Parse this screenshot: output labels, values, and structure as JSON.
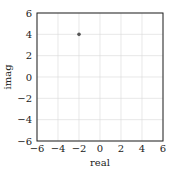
{
  "chart_data": {
    "type": "scatter",
    "title": "",
    "xlabel": "real",
    "ylabel": "imag",
    "xlim": [
      -6,
      6
    ],
    "ylim": [
      -6,
      6
    ],
    "xticks": [
      -6,
      -4,
      -2,
      0,
      2,
      4,
      6
    ],
    "yticks": [
      -6,
      -4,
      -2,
      0,
      2,
      4,
      6
    ],
    "xtick_labels": [
      "−6",
      "−4",
      "−2",
      "0",
      "2",
      "4",
      "6"
    ],
    "ytick_labels": [
      "−6",
      "−4",
      "−2",
      "0",
      "2",
      "4",
      "6"
    ],
    "grid": true,
    "legend": null,
    "series": [
      {
        "name": "point",
        "x": [
          -2
        ],
        "y": [
          4
        ],
        "color": "#555555"
      }
    ]
  },
  "colors": {
    "axes": "#222222",
    "grid": "#d9d9d9",
    "marker": "#555555"
  }
}
